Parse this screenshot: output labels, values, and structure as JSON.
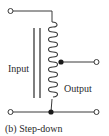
{
  "diagram": {
    "type": "autotransformer",
    "labels": {
      "input": "Input",
      "output": "Output",
      "caption": "(b) Step-down"
    },
    "colors": {
      "line": "#3a3a3a",
      "text": "#2a2a2a",
      "background": "#ffffff"
    },
    "coil_turns": 15,
    "terminals": [
      "top-left",
      "tap-right",
      "bottom-left",
      "bottom-right"
    ]
  }
}
